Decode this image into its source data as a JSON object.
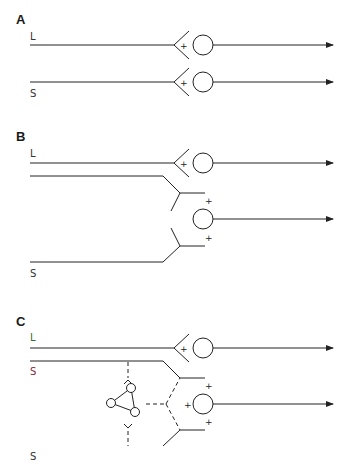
{
  "panels": {
    "A": {
      "label": "A",
      "inputs": [
        {
          "name": "L",
          "label": "L",
          "color": "#333333",
          "line_color": "#222222"
        },
        {
          "name": "S",
          "label": "S",
          "color": "#333333",
          "line_color": "#222222"
        }
      ],
      "synapse_sign": "+"
    },
    "B": {
      "label": "B",
      "inputs": [
        {
          "name": "L",
          "label": "L",
          "color": "#333333",
          "line_color": "#222222"
        },
        {
          "name": "S",
          "label": "S",
          "color": "#333333",
          "line_color": "#222222"
        }
      ],
      "synapse_sign": "+"
    },
    "C": {
      "label": "C",
      "inputs": [
        {
          "name": "L",
          "label": "L",
          "color": "#3a6b2a",
          "line_color": "#222222"
        },
        {
          "name": "S_top",
          "label": "S",
          "color": "#8a2a3a",
          "line_color": "#222222"
        },
        {
          "name": "S_bottom",
          "label": "S",
          "color": "#333333",
          "line_color": "#5a7fc0"
        }
      ],
      "synapse_sign": "+",
      "interneuron_network": "three-node triangle (dashed connections)"
    }
  },
  "colors": {
    "stroke": "#222222",
    "background": "#ffffff",
    "s_bottom_line_start": "#6aa84f",
    "s_bottom_line_end": "#4a6fd0"
  }
}
